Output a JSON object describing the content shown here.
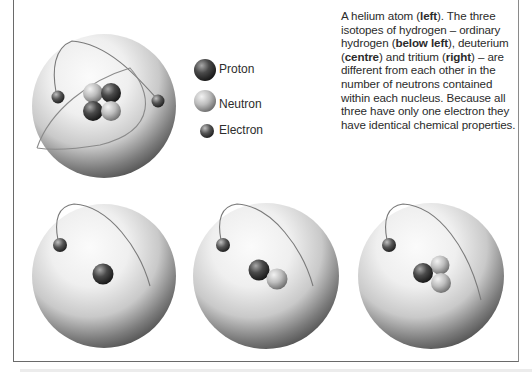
{
  "caption": {
    "parts": [
      {
        "text": "A helium atom (",
        "bold": false
      },
      {
        "text": "left",
        "bold": true
      },
      {
        "text": "). The three isotopes of hydrogen – ordinary hydrogen (",
        "bold": false
      },
      {
        "text": "below left",
        "bold": true
      },
      {
        "text": "), deuterium (",
        "bold": false
      },
      {
        "text": "centre",
        "bold": true
      },
      {
        "text": ") and tritium (",
        "bold": false
      },
      {
        "text": "right",
        "bold": true
      },
      {
        "text": ") – are different from each other in the number of neutrons contained within each nucleus. Because all three have only one electron they have identical chemical properties.",
        "bold": false
      }
    ]
  },
  "legend": {
    "items": [
      {
        "label": "Proton",
        "icon": "proton-ball"
      },
      {
        "label": "Neutron",
        "icon": "neutron-ball"
      },
      {
        "label": "Electron",
        "icon": "electron-ball"
      }
    ]
  },
  "figures": [
    {
      "name": "helium-atom",
      "position": "top left",
      "protons": 2,
      "neutrons": 2,
      "electrons": 2
    },
    {
      "name": "hydrogen-atom",
      "position": "below left",
      "protons": 1,
      "neutrons": 0,
      "electrons": 1
    },
    {
      "name": "deuterium-atom",
      "position": "centre",
      "protons": 1,
      "neutrons": 1,
      "electrons": 1
    },
    {
      "name": "tritium-atom",
      "position": "right",
      "protons": 1,
      "neutrons": 2,
      "electrons": 1
    }
  ],
  "colors": {
    "sphere_light": "#f4f4f4",
    "sphere_dark": "#4a4a4a",
    "proton": "#3a3a3a",
    "neutron": "#b8b8b8",
    "electron": "#4a4a4a",
    "border": "#6a6a6a"
  }
}
